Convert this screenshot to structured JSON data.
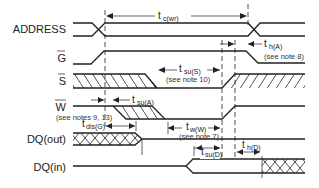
{
  "diagram": {
    "type": "timing-diagram",
    "signals": [
      {
        "name": "ADDRESS",
        "overbar": false
      },
      {
        "name": "G",
        "overbar": true
      },
      {
        "name": "S",
        "overbar": true
      },
      {
        "name": "W",
        "overbar": true
      },
      {
        "name": "DQ(out)",
        "overbar": false
      },
      {
        "name": "DQ(in)",
        "overbar": false
      }
    ],
    "timing_params": {
      "tc_wr": {
        "main": "t",
        "sub": "c(wr)"
      },
      "th_A": {
        "main": "t",
        "sub": "h(A)",
        "note": "(see note 8)"
      },
      "tsu_S": {
        "main": "t",
        "sub": "su(S)",
        "note": "(see note 10)"
      },
      "tsu_A": {
        "main": "t",
        "sub": "su(A)"
      },
      "w_note": "(see notes 9, 13)",
      "tdis_G": {
        "main": "t",
        "sub": "dis(G)"
      },
      "tw_W": {
        "main": "t",
        "sub": "w(W)",
        "note": "(see note 7)"
      },
      "tsu_D": {
        "main": "t",
        "sub": "su(D)"
      },
      "th_D": {
        "main": "t",
        "sub": "h(D)"
      }
    }
  }
}
